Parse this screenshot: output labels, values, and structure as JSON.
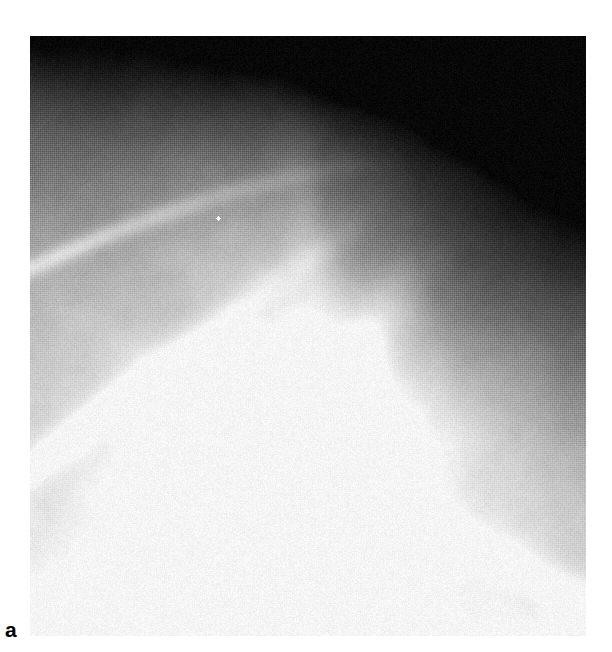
{
  "figure": {
    "panel_label": "a",
    "modality": "radiograph",
    "caption_text": "",
    "label_color": "#000000",
    "background_color": "#ffffff"
  },
  "image": {
    "name": "radiograph-plate",
    "alt_description": "Grayscale plain radiograph of the shoulder / upper thorax region showing overlapping rib and scapular cortical margins over a bright triangular bony density, with a very dark air-filled field in the upper right and a small white rectangular marker at the lower left corner.",
    "frame": {
      "x": 30,
      "y": 36,
      "width": 556,
      "height": 600
    },
    "palette": {
      "darkest": "#050505",
      "dark": "#1e1e1e",
      "mid_dark": "#454545",
      "mid": "#6e6e6e",
      "mid_light": "#9a9a9a",
      "light": "#c4c4c4",
      "brightest": "#f4f4f4",
      "marker_white": "#ffffff"
    },
    "texture": {
      "type": "halftone-screen",
      "description": "printed halftone dot screen visible as fine cross-hatch grid"
    },
    "features": [
      {
        "name": "dark-air-field-upper-right",
        "description": "Very dark low-density field occupying the upper right quadrant",
        "region": {
          "x": 300,
          "y": 0,
          "width": 256,
          "height": 330
        },
        "tone": "#060606"
      },
      {
        "name": "dark-field-upper-left",
        "description": "Dark band across the top left above the superior cortical margin",
        "region": {
          "x": 0,
          "y": 0,
          "width": 320,
          "height": 120
        },
        "tone": "#161616"
      },
      {
        "name": "superior-cortical-margin",
        "description": "Thin bright curved cortical line sweeping from the left edge up toward the centre",
        "tone": "#b8b8b8"
      },
      {
        "name": "upper-rib-band",
        "description": "Oblique bright rib band running from lower left to upper centre",
        "tone": "#a8a8a8"
      },
      {
        "name": "second-rib-band",
        "description": "Second parallel oblique rib band below the first",
        "tone": "#9c9c9c"
      },
      {
        "name": "central-bright-density",
        "description": "Large bright triangular radiopaque bony density in the centre-lower half",
        "region": {
          "x": 140,
          "y": 270,
          "width": 280,
          "height": 290
        },
        "tone": "#ecebe8"
      },
      {
        "name": "inferior-oblique-margin",
        "description": "Bright oblique margin descending to the lower right corner",
        "tone": "#bdbdbd"
      },
      {
        "name": "soft-tissue-lower-field",
        "description": "Uniform mid-grey soft tissue field across the lower portion",
        "tone": "#8f8f8f"
      },
      {
        "name": "corner-marker",
        "description": "Small white rectangular marker block at the lower left corner of the plate",
        "region": {
          "x": 0,
          "y": 565,
          "width": 58,
          "height": 35
        },
        "tone": "#ffffff"
      },
      {
        "name": "calcific-dot",
        "description": "Tiny bright punctate density in the upper central field",
        "region": {
          "x": 186,
          "y": 180,
          "width": 4,
          "height": 4
        },
        "tone": "#ffffff"
      }
    ]
  }
}
